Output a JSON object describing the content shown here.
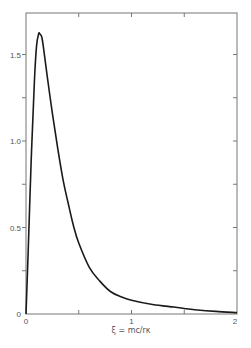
{
  "chart_data": {
    "type": "line",
    "title": "",
    "xlabel": "ξ = mc/rκ",
    "ylabel": "",
    "xlim": [
      0,
      2
    ],
    "ylim": [
      0,
      1.74
    ],
    "grid": false,
    "legend": null,
    "x_ticks": [
      {
        "value": 0,
        "label": "0"
      },
      {
        "value": 0.5,
        "label": ""
      },
      {
        "value": 1,
        "label": "1"
      },
      {
        "value": 1.5,
        "label": ""
      },
      {
        "value": 2,
        "label": "2"
      }
    ],
    "y_ticks": [
      {
        "value": 0,
        "label": "0"
      },
      {
        "value": 0.25,
        "label": ""
      },
      {
        "value": 0.5,
        "label": "0.5"
      },
      {
        "value": 0.75,
        "label": ""
      },
      {
        "value": 1.0,
        "label": "1.0"
      },
      {
        "value": 1.25,
        "label": ""
      },
      {
        "value": 1.5,
        "label": "1.5"
      }
    ],
    "series": [
      {
        "name": "distribution",
        "x": [
          0,
          0.02,
          0.05,
          0.08,
          0.1,
          0.12,
          0.13,
          0.15,
          0.17,
          0.2,
          0.25,
          0.3,
          0.35,
          0.4,
          0.45,
          0.5,
          0.6,
          0.7,
          0.8,
          0.9,
          1.0,
          1.2,
          1.4,
          1.5,
          1.6,
          1.8,
          2.0
        ],
        "values": [
          0,
          0.35,
          0.9,
          1.35,
          1.55,
          1.62,
          1.62,
          1.6,
          1.52,
          1.38,
          1.16,
          0.96,
          0.78,
          0.64,
          0.51,
          0.41,
          0.27,
          0.19,
          0.13,
          0.1,
          0.08,
          0.055,
          0.04,
          0.032,
          0.025,
          0.015,
          0.008
        ]
      }
    ]
  },
  "axes": {
    "x_tick_labels": [
      "0",
      "1",
      "2"
    ],
    "y_tick_labels": [
      "0",
      "0.5",
      "1.0",
      "1.5"
    ],
    "x_title": "ξ = mc/rκ"
  },
  "colors": {
    "curve": "#1a1a1a",
    "frame": "#777777",
    "text": "#555555"
  }
}
